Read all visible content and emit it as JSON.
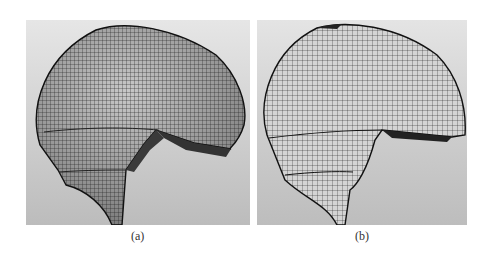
{
  "figure": {
    "panels": [
      {
        "id": "a",
        "caption": "(a)",
        "content": "shaded 3D helmet-shaped quad mesh, side view"
      },
      {
        "id": "b",
        "caption": "(b)",
        "content": "flattened wireframe helmet-shaped quad mesh, side view"
      }
    ],
    "colors": {
      "background": "#ffffff",
      "panel_bg": "#cfcfcf",
      "mesh_line": "#1e1e1e"
    }
  }
}
